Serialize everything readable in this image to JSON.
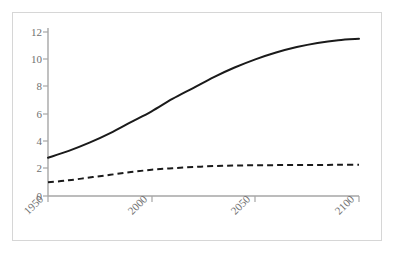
{
  "chart_data": {
    "type": "line",
    "title": "",
    "subtitle": "",
    "xlabel": "",
    "ylabel": "",
    "xlim": [
      1950,
      2100
    ],
    "ylim": [
      0,
      12
    ],
    "grid": false,
    "legend": "none",
    "x_ticks": [
      "1950",
      "2000",
      "2050",
      "2100"
    ],
    "x_tick_values": [
      1950,
      2000,
      2050,
      2100
    ],
    "y_ticks": [
      "0",
      "2",
      "4",
      "6",
      "8",
      "10",
      "12"
    ],
    "y_tick_values": [
      0,
      2,
      4,
      6,
      8,
      10,
      12
    ],
    "x": [
      1950,
      1960,
      1970,
      1980,
      1990,
      2000,
      2010,
      2020,
      2030,
      2040,
      2050,
      2060,
      2070,
      2080,
      2090,
      2100
    ],
    "series": [
      {
        "name": "solid-series",
        "style": "solid",
        "color": "#1a1a1a",
        "width": 2,
        "values": [
          2.8,
          3.3,
          3.9,
          4.6,
          5.4,
          6.2,
          7.1,
          7.9,
          8.7,
          9.4,
          10.0,
          10.5,
          10.9,
          11.2,
          11.4,
          11.5
        ]
      },
      {
        "name": "dashed-series",
        "style": "dashed",
        "color": "#1a1a1a",
        "width": 2,
        "values": [
          1.0,
          1.15,
          1.35,
          1.55,
          1.75,
          1.92,
          2.03,
          2.12,
          2.19,
          2.23,
          2.25,
          2.26,
          2.27,
          2.27,
          2.28,
          2.28
        ]
      }
    ],
    "axis_color": "#a6a6a6",
    "frame_color": "#d6d6d6",
    "tick_label_color": "#6f6f6f",
    "x_label_rotation": -45
  }
}
